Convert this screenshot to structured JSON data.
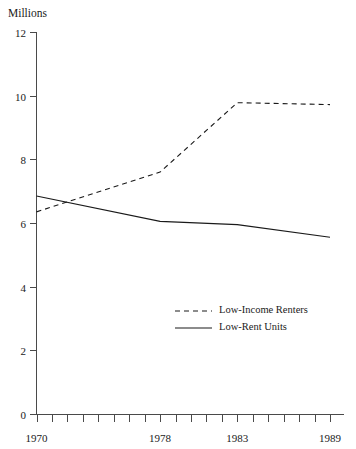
{
  "chart_data": {
    "type": "line",
    "title": "",
    "ylabel": "Millions",
    "xlabel": "",
    "ylim": [
      0,
      12
    ],
    "y_ticks": [
      0,
      2,
      4,
      6,
      8,
      10,
      12
    ],
    "y_tick_labels": [
      "0",
      "2",
      "4",
      "6",
      "8",
      "10",
      "12"
    ],
    "xlim": [
      1970,
      1989
    ],
    "x_tick_labels": [
      "1970",
      "1978",
      "1983",
      "1989"
    ],
    "x_tick_label_values": [
      1970,
      1978,
      1983,
      1989
    ],
    "x_minor_ticks": [
      1970,
      1971,
      1972,
      1973,
      1974,
      1975,
      1976,
      1977,
      1978,
      1979,
      1980,
      1981,
      1982,
      1983,
      1984,
      1985,
      1986,
      1987,
      1988,
      1989
    ],
    "grid": false,
    "legend_position": "center-right",
    "series": [
      {
        "name": "Low-Income Renters",
        "style": "dashed",
        "color": "#1a1a1a",
        "x": [
          1970,
          1978,
          1983,
          1989
        ],
        "values": [
          6.35,
          7.6,
          9.78,
          9.72
        ]
      },
      {
        "name": "Low-Rent Units",
        "style": "solid",
        "color": "#1a1a1a",
        "x": [
          1970,
          1978,
          1983,
          1989
        ],
        "values": [
          6.85,
          6.05,
          5.95,
          5.55
        ]
      }
    ]
  },
  "legend": {
    "entries": [
      {
        "label": "Low-Income Renters",
        "style": "dashed"
      },
      {
        "label": "Low-Rent Units",
        "style": "solid"
      }
    ]
  }
}
